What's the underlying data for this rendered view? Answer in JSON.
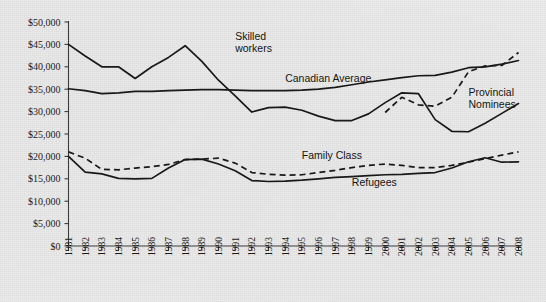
{
  "chart_data": {
    "type": "line",
    "title": "",
    "subtitle": "",
    "xlabel": "",
    "ylabel": "",
    "xlim": [
      1981,
      2008
    ],
    "ylim": [
      0,
      50000
    ],
    "grid": false,
    "legend_position": "inline-annotations",
    "x": [
      1981,
      1982,
      1983,
      1984,
      1985,
      1986,
      1987,
      1988,
      1989,
      1990,
      1991,
      1992,
      1993,
      1994,
      1995,
      1996,
      1997,
      1998,
      1999,
      2000,
      2001,
      2002,
      2003,
      2004,
      2005,
      2006,
      2007,
      2008
    ],
    "ytick_labels": [
      "$0",
      "$5,000",
      "$10,000",
      "$15,000",
      "$20,000",
      "$25,000",
      "$30,000",
      "$35,000",
      "$40,000",
      "$45,000",
      "$50,000"
    ],
    "ytick_values": [
      0,
      5000,
      10000,
      15000,
      20000,
      25000,
      30000,
      35000,
      40000,
      45000,
      50000
    ],
    "xtick_labels": [
      "1981",
      "1982",
      "1983",
      "1984",
      "1985",
      "1986",
      "1987",
      "1988",
      "1989",
      "1990",
      "1991",
      "1992",
      "1993",
      "1994",
      "1995",
      "1996",
      "1997",
      "1998",
      "1999",
      "2000",
      "2001",
      "2002",
      "2003",
      "2004",
      "2005",
      "2006",
      "2007",
      "2008"
    ],
    "series": [
      {
        "name": "Skilled workers",
        "style": "solid",
        "label_text": "Skilled\nworkers",
        "label_lines": [
          "Skilled",
          "workers"
        ],
        "x": [
          1981,
          1982,
          1983,
          1984,
          1985,
          1986,
          1987,
          1988,
          1989,
          1990,
          1991,
          1992,
          1993,
          1994,
          1995,
          1996,
          1997,
          1998,
          1999,
          2000,
          2001,
          2002,
          2003,
          2004,
          2005,
          2006,
          2007,
          2008
        ],
        "values": [
          45000,
          42400,
          40000,
          40000,
          37400,
          40000,
          42100,
          44700,
          41200,
          37000,
          33500,
          29900,
          30900,
          31000,
          30300,
          29000,
          28000,
          28000,
          29500,
          32000,
          34200,
          34000,
          28200,
          25600,
          25500,
          27400,
          29600,
          31800
        ]
      },
      {
        "name": "Canadian Average",
        "style": "solid",
        "label_text": "Canadian Average",
        "label_lines": [
          "Canadian Average"
        ],
        "x": [
          1981,
          1982,
          1983,
          1984,
          1985,
          1986,
          1987,
          1988,
          1989,
          1990,
          1991,
          1992,
          1993,
          1994,
          1995,
          1996,
          1997,
          1998,
          1999,
          2000,
          2001,
          2002,
          2003,
          2004,
          2005,
          2006,
          2007,
          2008
        ],
        "values": [
          35100,
          34700,
          34000,
          34200,
          34500,
          34500,
          34700,
          34800,
          34900,
          34900,
          34800,
          34700,
          34700,
          34700,
          34800,
          35000,
          35400,
          36000,
          36600,
          37100,
          37600,
          38000,
          38100,
          38800,
          39800,
          40000,
          40600,
          41400
        ]
      },
      {
        "name": "Provincial Nominees",
        "style": "dashed",
        "label_text": "Provincial\nNominees",
        "label_lines": [
          "Provincial",
          "Nominees"
        ],
        "x": [
          2000,
          2001,
          2002,
          2003,
          2004,
          2005,
          2006,
          2007,
          2008
        ],
        "values": [
          29800,
          33200,
          31500,
          31200,
          33200,
          38900,
          40200,
          40300,
          43200
        ]
      },
      {
        "name": "Family Class",
        "style": "dashed",
        "label_text": "Family Class",
        "label_lines": [
          "Family Class"
        ],
        "x": [
          1981,
          1982,
          1983,
          1984,
          1985,
          1986,
          1987,
          1988,
          1989,
          1990,
          1991,
          1992,
          1993,
          1994,
          1995,
          1996,
          1997,
          1998,
          1999,
          2000,
          2001,
          2002,
          2003,
          2004,
          2005,
          2006,
          2007,
          2008
        ],
        "values": [
          21000,
          19600,
          17100,
          17000,
          17400,
          17700,
          18200,
          19300,
          19400,
          19600,
          18500,
          16400,
          16000,
          15800,
          15900,
          16400,
          16900,
          17500,
          18000,
          18300,
          18000,
          17500,
          17500,
          18000,
          18700,
          19500,
          20300,
          21000
        ]
      },
      {
        "name": "Refugees",
        "style": "solid",
        "label_text": "Refugees",
        "label_lines": [
          "Refugees"
        ],
        "x": [
          1981,
          1982,
          1983,
          1984,
          1985,
          1986,
          1987,
          1988,
          1989,
          1990,
          1991,
          1992,
          1993,
          1994,
          1995,
          1996,
          1997,
          1998,
          1999,
          2000,
          2001,
          2002,
          2003,
          2004,
          2005,
          2006,
          2007,
          2008
        ],
        "values": [
          20000,
          16500,
          16100,
          15100,
          15000,
          15100,
          17400,
          19300,
          19400,
          18300,
          16800,
          14600,
          14400,
          14500,
          14700,
          15000,
          15300,
          15500,
          15700,
          15900,
          16000,
          16200,
          16400,
          17400,
          18800,
          19700,
          18700,
          18800
        ]
      }
    ],
    "annotations": [
      {
        "text": "Skilled workers",
        "x": 1991,
        "y": 46000
      },
      {
        "text": "Canadian Average",
        "x": 1994,
        "y": 36500
      },
      {
        "text": "Provincial Nominees",
        "x": 2005,
        "y": 33500
      },
      {
        "text": "Family Class",
        "x": 1995,
        "y": 19500
      },
      {
        "text": "Refugees",
        "x": 1998,
        "y": 13500
      }
    ],
    "colors": {
      "line": "#141414",
      "axis": "#3a3a3a",
      "background": "#ececec",
      "text": "#171717"
    }
  }
}
